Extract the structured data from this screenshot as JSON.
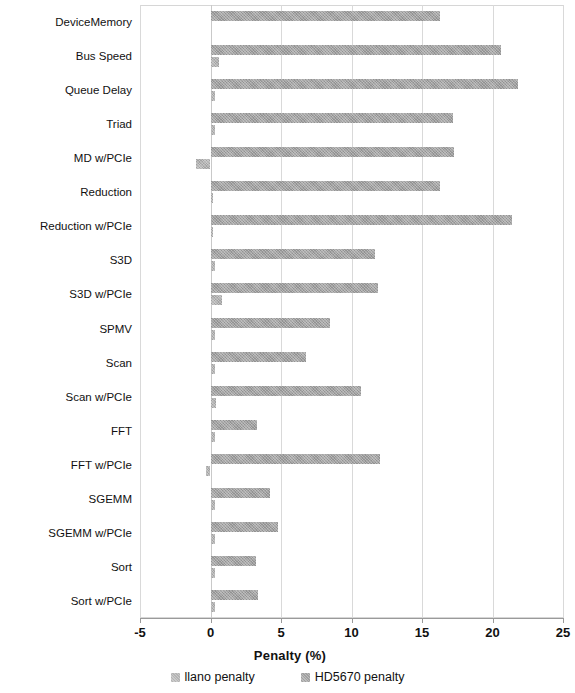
{
  "chart_data": {
    "type": "bar",
    "orientation": "horizontal",
    "title": "",
    "xlabel": "Penalty (%)",
    "ylabel": "",
    "xlim": [
      -5,
      25
    ],
    "xticks": [
      -5,
      0,
      5,
      10,
      15,
      20,
      25
    ],
    "xtick_labels": [
      "-5",
      "0",
      "5",
      "10",
      "15",
      "20",
      "25"
    ],
    "grid": true,
    "legend_position": "bottom",
    "categories": [
      "DeviceMemory",
      "Bus Speed",
      "Queue Delay",
      "Triad",
      "MD w/PCIe",
      "Reduction",
      "Reduction w/PCIe",
      "S3D",
      "S3D w/PCIe",
      "SPMV",
      "Scan",
      "Scan w/PCIe",
      "FFT",
      "FFT w/PCIe",
      "SGEMM",
      "SGEMM w/PCIe",
      "Sort",
      "Sort w/PCIe"
    ],
    "series": [
      {
        "name": "llano penalty",
        "color": "#b4b4b4",
        "values": [
          0.0,
          0.6,
          0.3,
          0.3,
          -1.0,
          0.2,
          0.2,
          0.3,
          0.8,
          0.3,
          0.3,
          0.4,
          0.3,
          -0.3,
          0.3,
          0.3,
          0.3,
          0.3
        ]
      },
      {
        "name": "HD5670 penalty",
        "color": "#a3a3a3",
        "values": [
          16.3,
          20.6,
          21.8,
          17.2,
          17.3,
          16.3,
          21.4,
          11.7,
          11.9,
          8.5,
          6.8,
          10.7,
          3.3,
          12.0,
          4.2,
          4.8,
          3.2,
          3.4
        ]
      }
    ]
  },
  "legend": {
    "items": [
      {
        "label": "llano penalty"
      },
      {
        "label": "HD5670 penalty"
      }
    ]
  }
}
